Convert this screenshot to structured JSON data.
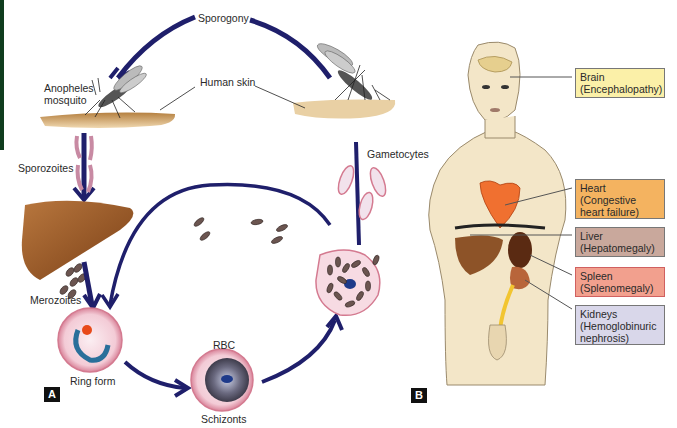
{
  "panel_a": {
    "letter": "A",
    "labels": {
      "sporogony": "Sporogony",
      "anopheles": "Anopheles",
      "mosquito": "mosquito",
      "human_skin": "Human skin",
      "sporozoites": "Sporozoites",
      "merozoites": "Merozoites",
      "ring_form": "Ring form",
      "rbc": "RBC",
      "schizonts": "Schizonts",
      "gametocytes": "Gametocytes"
    }
  },
  "panel_b": {
    "letter": "B",
    "organs": [
      {
        "name": "Brain",
        "condition": "(Encephalopathy)",
        "color": "#fbf0a8"
      },
      {
        "name": "Heart",
        "condition": "(Congestive",
        "condition2": "heart failure)",
        "color": "#f4b360"
      },
      {
        "name": "Liver",
        "condition": "(Hepatomegaly)",
        "color": "#c9a89c"
      },
      {
        "name": "Spleen",
        "condition": "(Splenomegaly)",
        "color": "#f2a08e"
      },
      {
        "name": "Kidneys",
        "condition": "(Hemoglobinuric",
        "condition2": "nephrosis)",
        "color": "#d9d7ea"
      }
    ]
  },
  "colors": {
    "arrow": "#1f1f6b",
    "skin": "#c49a5c",
    "liver": "#9a5a26",
    "body": "#f3e6c8",
    "rbc_pink": "#f0c6d0"
  }
}
